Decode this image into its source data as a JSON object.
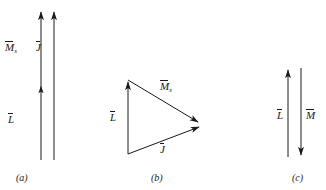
{
  "figure": {
    "background_color": "#ffffff",
    "stroke_color": "#1a1a1a",
    "panels": [
      {
        "id": "a",
        "caption": "(a)",
        "description": "two parallel vertical arrows pointing up",
        "labels": [
          {
            "name": "M-s",
            "symbol": "M",
            "subscript": "s",
            "overbar": true
          },
          {
            "name": "J",
            "symbol": "J",
            "subscript": "",
            "overbar": true
          },
          {
            "name": "L",
            "symbol": "L",
            "subscript": "",
            "overbar": true
          }
        ]
      },
      {
        "id": "b",
        "caption": "(b)",
        "description": "vector triangle: L up the left side, M-s down-right to apex, J from bottom-left up-right to apex",
        "labels": [
          {
            "name": "M-s",
            "symbol": "M",
            "subscript": "s",
            "overbar": true
          },
          {
            "name": "L",
            "symbol": "L",
            "subscript": "",
            "overbar": true
          },
          {
            "name": "J",
            "symbol": "J",
            "subscript": "",
            "overbar": true
          }
        ]
      },
      {
        "id": "c",
        "caption": "(c)",
        "description": "two antiparallel vertical arrows: L pointing up, M pointing down",
        "labels": [
          {
            "name": "L",
            "symbol": "L",
            "subscript": "",
            "overbar": true
          },
          {
            "name": "M",
            "symbol": "M",
            "subscript": "",
            "overbar": true
          }
        ]
      }
    ],
    "caption_a": "(a)",
    "caption_b": "(b)",
    "caption_c": "(c)",
    "sym_M": "M",
    "sym_sub_s": "s",
    "sym_J": "J",
    "sym_L": "L"
  }
}
